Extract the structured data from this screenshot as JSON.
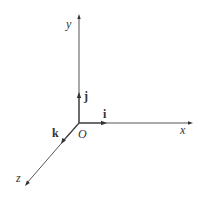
{
  "diagram": {
    "type": "3d-coordinate-axes",
    "axes": [
      {
        "name": "x",
        "label": "x"
      },
      {
        "name": "y",
        "label": "y"
      },
      {
        "name": "z",
        "label": "z"
      }
    ],
    "origin_label": "O",
    "unit_vectors": [
      {
        "name": "i",
        "label": "i",
        "along": "x"
      },
      {
        "name": "j",
        "label": "j",
        "along": "y"
      },
      {
        "name": "k",
        "label": "k",
        "along": "z"
      }
    ]
  }
}
